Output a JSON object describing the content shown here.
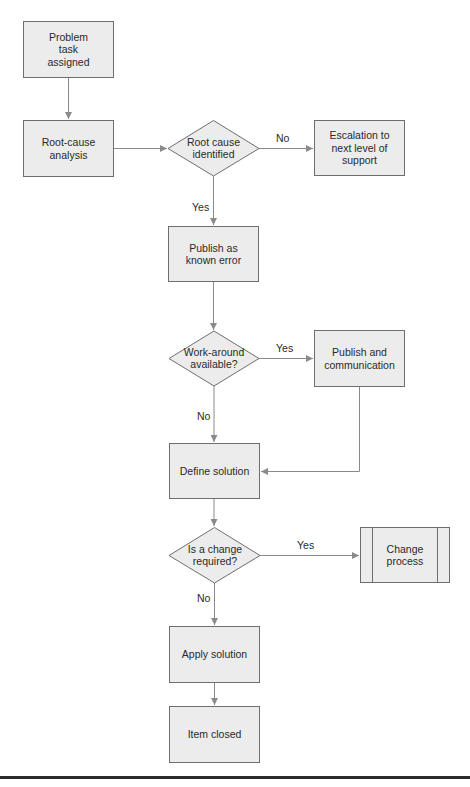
{
  "diagram": {
    "type": "flowchart",
    "colors": {
      "node_fill": "#ececec",
      "node_border": "#6e6e6e",
      "connector": "#8a8a8a",
      "text": "#2a2a2a",
      "bottom_rule": "#2b2b2b"
    },
    "nodes": {
      "problem_task": {
        "shape": "process",
        "label": "Problem task assigned"
      },
      "root_cause_analysis": {
        "shape": "process",
        "label": "Root-cause analysis"
      },
      "root_cause_identified": {
        "shape": "decision",
        "label": "Root cause identified"
      },
      "escalation": {
        "shape": "process",
        "label": "Escalation to next level of support"
      },
      "publish_known_error": {
        "shape": "process",
        "label": "Publish as known error"
      },
      "workaround_available": {
        "shape": "decision",
        "label": "Work-around available?"
      },
      "publish_communication": {
        "shape": "process",
        "label": "Publish and communication"
      },
      "define_solution": {
        "shape": "process",
        "label": "Define solution"
      },
      "change_required": {
        "shape": "decision",
        "label": "Is a change required?"
      },
      "change_process": {
        "shape": "predefined-process",
        "label": "Change process"
      },
      "apply_solution": {
        "shape": "process",
        "label": "Apply solution"
      },
      "item_closed": {
        "shape": "process",
        "label": "Item closed"
      }
    },
    "edge_labels": {
      "rc_no": "No",
      "rc_yes": "Yes",
      "wa_yes": "Yes",
      "wa_no": "No",
      "chg_yes": "Yes",
      "chg_no": "No"
    },
    "edges": [
      {
        "from": "problem_task",
        "to": "root_cause_analysis",
        "label": ""
      },
      {
        "from": "root_cause_analysis",
        "to": "root_cause_identified",
        "label": ""
      },
      {
        "from": "root_cause_identified",
        "to": "escalation",
        "label": "No"
      },
      {
        "from": "root_cause_identified",
        "to": "publish_known_error",
        "label": "Yes"
      },
      {
        "from": "publish_known_error",
        "to": "workaround_available",
        "label": ""
      },
      {
        "from": "workaround_available",
        "to": "publish_communication",
        "label": "Yes"
      },
      {
        "from": "workaround_available",
        "to": "define_solution",
        "label": "No"
      },
      {
        "from": "publish_communication",
        "to": "define_solution",
        "label": ""
      },
      {
        "from": "define_solution",
        "to": "change_required",
        "label": ""
      },
      {
        "from": "change_required",
        "to": "change_process",
        "label": "Yes"
      },
      {
        "from": "change_required",
        "to": "apply_solution",
        "label": "No"
      },
      {
        "from": "apply_solution",
        "to": "item_closed",
        "label": ""
      }
    ]
  }
}
